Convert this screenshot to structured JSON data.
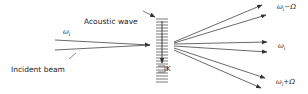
{
  "diagram": {
    "labels": {
      "acoustic_wave": "Acoustic wave",
      "incident_beam": "Incident beam",
      "incident_freq": "ω",
      "incident_freq_sub": "i",
      "wave_vector": "K",
      "out_minus": "ω",
      "out_minus_sub": "i",
      "out_minus_suffix": "−Ω",
      "out_center": "ω",
      "out_center_sub": "i",
      "out_plus": "ω",
      "out_plus_sub": "i",
      "out_plus_suffix": "+Ω"
    },
    "colors": {
      "line": "#444444",
      "text": "#222222",
      "background": "#ffffff"
    },
    "grating": {
      "line_count": 22
    },
    "output_beams": [
      {
        "order": "ω_i − Ω",
        "count": 2
      },
      {
        "order": "ω_i",
        "count": 2
      },
      {
        "order": "ω_i + Ω",
        "count": 2
      }
    ]
  }
}
